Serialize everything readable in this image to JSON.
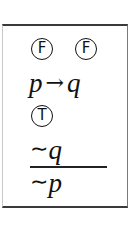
{
  "argument": {
    "truth_values_top": [
      "F",
      "F"
    ],
    "premise_1": {
      "antecedent": "p",
      "connective": "→",
      "consequent": "q"
    },
    "truth_value_premise_1": "T",
    "premise_2": {
      "negation": "∼",
      "variable": "q"
    },
    "conclusion": {
      "negation": "∼",
      "variable": "p"
    }
  }
}
